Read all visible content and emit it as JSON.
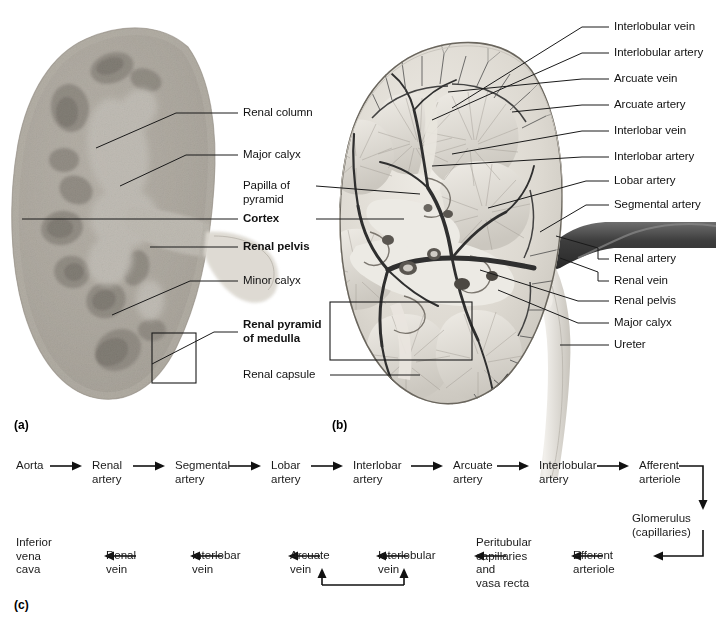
{
  "figure": {
    "panels": [
      {
        "id": "a",
        "letter": "(a)",
        "caption": "Photograph of coronally sectioned kidney"
      },
      {
        "id": "b",
        "letter": "(b)",
        "caption": "Illustration of coronally sectioned kidney with renal vasculature"
      },
      {
        "id": "c",
        "letter": "(c)",
        "caption": "Flowchart of renal blood flow"
      }
    ]
  },
  "panel_a": {
    "labels": [
      {
        "id": "renal-column",
        "text": "Renal column",
        "bold": false
      },
      {
        "id": "major-calyx",
        "text": "Major calyx",
        "bold": false
      },
      {
        "id": "papilla-of-pyramid",
        "text": "Papilla of\npyramid",
        "bold": false
      },
      {
        "id": "cortex",
        "text": "Cortex",
        "bold": true
      },
      {
        "id": "renal-pelvis",
        "text": "Renal pelvis",
        "bold": true
      },
      {
        "id": "minor-calyx",
        "text": "Minor calyx",
        "bold": false
      },
      {
        "id": "renal-pyramid-of-medulla",
        "text": "Renal pyramid\nof medulla",
        "bold": true
      },
      {
        "id": "renal-capsule",
        "text": "Renal capsule",
        "bold": false
      }
    ]
  },
  "panel_b": {
    "labels": [
      {
        "id": "interlobular-vein",
        "text": "Interlobular vein"
      },
      {
        "id": "interlobular-artery",
        "text": "Interlobular artery"
      },
      {
        "id": "arcuate-vein",
        "text": "Arcuate vein"
      },
      {
        "id": "arcuate-artery",
        "text": "Arcuate artery"
      },
      {
        "id": "interlobar-vein",
        "text": "Interlobar vein"
      },
      {
        "id": "interlobar-artery",
        "text": "Interlobar artery"
      },
      {
        "id": "lobar-artery",
        "text": "Lobar artery"
      },
      {
        "id": "segmental-artery",
        "text": "Segmental artery"
      },
      {
        "id": "renal-artery",
        "text": "Renal artery"
      },
      {
        "id": "renal-vein",
        "text": "Renal vein"
      },
      {
        "id": "renal-pelvis",
        "text": "Renal pelvis"
      },
      {
        "id": "major-calyx",
        "text": "Major calyx"
      },
      {
        "id": "ureter",
        "text": "Ureter"
      }
    ]
  },
  "panel_c": {
    "arterial_row": [
      {
        "id": "aorta",
        "text": "Aorta"
      },
      {
        "id": "renal-artery",
        "text": "Renal\nartery"
      },
      {
        "id": "segmental-artery",
        "text": "Segmental\nartery"
      },
      {
        "id": "lobar-artery",
        "text": "Lobar\nartery"
      },
      {
        "id": "interlobar-artery",
        "text": "Interlobar\nartery"
      },
      {
        "id": "arcuate-artery",
        "text": "Arcuate\nartery"
      },
      {
        "id": "interlobular-artery",
        "text": "Interlobular\nartery"
      },
      {
        "id": "afferent-arteriole",
        "text": "Afferent\narteriole"
      }
    ],
    "glomerulus": {
      "id": "glomerulus",
      "text": "Glomerulus\n(capillaries)"
    },
    "venous_row": [
      {
        "id": "inferior-vena-cava",
        "text": "Inferior\nvena\ncava"
      },
      {
        "id": "renal-vein",
        "text": "Renal\nvein"
      },
      {
        "id": "interlobar-vein",
        "text": "Interlobar\nvein"
      },
      {
        "id": "arcuate-vein",
        "text": "Arcuate\nvein"
      },
      {
        "id": "interlobular-vein",
        "text": "Interlobular\nvein"
      },
      {
        "id": "peritubular-capillaries",
        "text": "Peritubular\ncapillaries\nand\nvasa recta"
      },
      {
        "id": "efferent-arteriole",
        "text": "Efferent\narteriole"
      }
    ]
  },
  "colors": {
    "leader_line": "#1a1a1a",
    "arrow": "#111111",
    "text": "#111111",
    "background": "#ffffff",
    "tissue_cortex": "#b9b4ab",
    "tissue_medulla": "#7d7870",
    "vessel_dark": "#3a3a3a",
    "pelvis_light": "#e6e3dc"
  }
}
